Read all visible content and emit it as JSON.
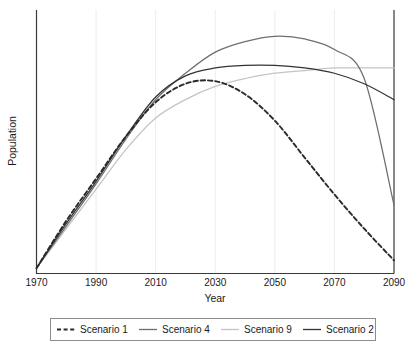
{
  "chart_data": {
    "type": "line",
    "title": "",
    "xlabel": "Year",
    "ylabel": "Population",
    "xlim": [
      1970,
      2090
    ],
    "ylim": [
      0,
      100
    ],
    "grid": "vertical-only",
    "y_tick_labels": [],
    "legend_position": "bottom-outside",
    "x_ticks": [
      1970,
      1990,
      2010,
      2030,
      2050,
      2070,
      2090
    ],
    "x_tick_labels": [
      "1970",
      "1990",
      "2010",
      "2030",
      "2050",
      "2070",
      "2090"
    ],
    "x": [
      1970,
      1980,
      1990,
      2000,
      2010,
      2020,
      2030,
      2040,
      2050,
      2060,
      2070,
      2080,
      2090
    ],
    "series": [
      {
        "name": "Scenario 1",
        "style": "dashed",
        "color": "#2a2a2a",
        "values": [
          2,
          20,
          36,
          52,
          65,
          72,
          73,
          68,
          58,
          44,
          30,
          17,
          5
        ]
      },
      {
        "name": "Scenario 4",
        "style": "solid",
        "color": "#6e6e6e",
        "values": [
          2,
          18,
          34,
          51,
          66,
          76,
          84,
          88,
          90,
          89,
          85,
          74,
          26
        ]
      },
      {
        "name": "Scenario 9",
        "style": "solid",
        "color": "#c4c4c4",
        "values": [
          2,
          17,
          32,
          47,
          59,
          66,
          71,
          74,
          76,
          77,
          78,
          78,
          78
        ]
      },
      {
        "name": "Scenario 2",
        "style": "solid",
        "color": "#333333",
        "values": [
          2,
          19,
          35,
          52,
          67,
          75,
          78,
          79,
          79,
          78,
          76,
          72,
          66
        ]
      }
    ]
  },
  "legend": {
    "entries": [
      {
        "label": "Scenario 1"
      },
      {
        "label": "Scenario 4"
      },
      {
        "label": "Scenario 9"
      },
      {
        "label": "Scenario 2"
      }
    ]
  }
}
